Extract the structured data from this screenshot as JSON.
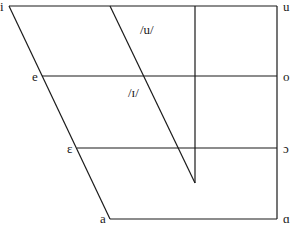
{
  "diagram": {
    "corner_vowels": {
      "front": [
        {
          "symbol": "i",
          "row": "close"
        },
        {
          "symbol": "e",
          "row": "close-mid"
        },
        {
          "symbol": "ε",
          "row": "open-mid"
        },
        {
          "symbol": "a",
          "row": "open"
        }
      ],
      "back": [
        {
          "symbol": "u",
          "row": "close"
        },
        {
          "symbol": "o",
          "row": "close-mid"
        },
        {
          "symbol": "ɔ",
          "row": "open-mid"
        },
        {
          "symbol": "ɑ",
          "row": "open"
        }
      ]
    },
    "phoneme_labels": [
      {
        "text": "/u/"
      },
      {
        "text": "/ɪ/"
      }
    ],
    "colors": {
      "line": "#1a1a1a",
      "background": "#ffffff"
    }
  }
}
